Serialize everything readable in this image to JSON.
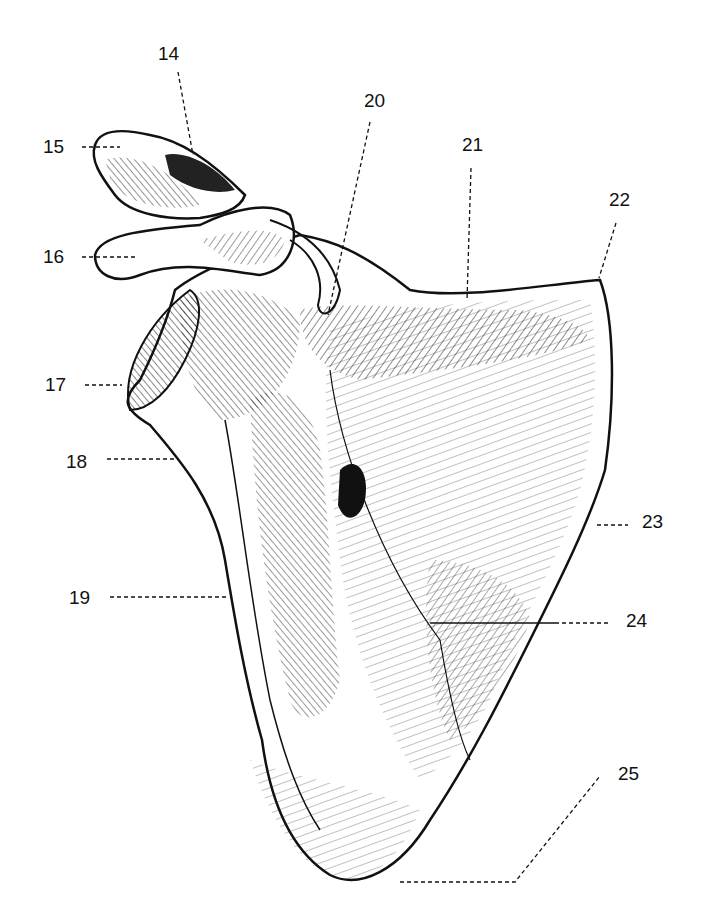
{
  "figure": {
    "ink_color": "#111111",
    "paper_color": "#ffffff"
  },
  "labels": [
    {
      "id": "14",
      "text": "14",
      "x": 158,
      "y": 44
    },
    {
      "id": "15",
      "text": "15",
      "x": 43,
      "y": 137
    },
    {
      "id": "16",
      "text": "16",
      "x": 43,
      "y": 247
    },
    {
      "id": "17",
      "text": "17",
      "x": 45,
      "y": 375
    },
    {
      "id": "18",
      "text": "18",
      "x": 66,
      "y": 452
    },
    {
      "id": "19",
      "text": "19",
      "x": 69,
      "y": 588
    },
    {
      "id": "20",
      "text": "20",
      "x": 364,
      "y": 91
    },
    {
      "id": "21",
      "text": "21",
      "x": 462,
      "y": 135
    },
    {
      "id": "22",
      "text": "22",
      "x": 609,
      "y": 190
    },
    {
      "id": "23",
      "text": "23",
      "x": 642,
      "y": 512
    },
    {
      "id": "24",
      "text": "24",
      "x": 626,
      "y": 611
    },
    {
      "id": "25",
      "text": "25",
      "x": 618,
      "y": 764
    }
  ]
}
